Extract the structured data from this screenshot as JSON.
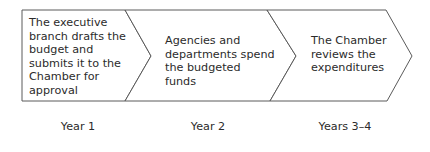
{
  "diagram": {
    "type": "process-flow-chevrons",
    "stroke_color": "#5a5a5a",
    "fill_color": "#ffffff",
    "steps": [
      {
        "id": 1,
        "text": "The executive branch drafts the budget and submits it to the Chamber for approval",
        "period": "Year 1"
      },
      {
        "id": 2,
        "text": "Agencies and departments spend the budgeted funds",
        "period": "Year 2"
      },
      {
        "id": 3,
        "text": "The Chamber reviews the expenditures",
        "period": "Years 3–4"
      }
    ]
  }
}
